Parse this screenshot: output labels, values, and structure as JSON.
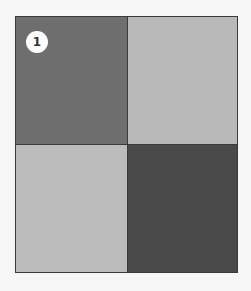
{
  "badge": {
    "label": "1"
  },
  "cells": [
    {
      "id": "top-left",
      "color": "#6e6e6e"
    },
    {
      "id": "top-right",
      "color": "#b9b9b9"
    },
    {
      "id": "bottom-left",
      "color": "#bcbcbc"
    },
    {
      "id": "bottom-right",
      "color": "#4a4a4a"
    }
  ]
}
